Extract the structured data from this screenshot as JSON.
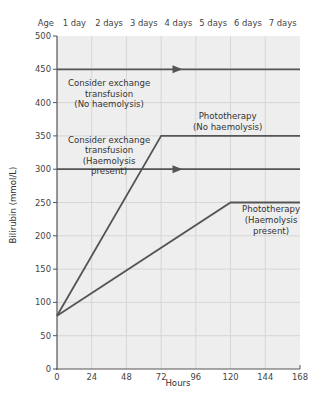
{
  "chart_data": {
    "type": "line",
    "title": "",
    "xlabel": "Hours",
    "ylabel": "Bilirubin (mmol/L)",
    "xlim": [
      0,
      168
    ],
    "ylim": [
      0,
      500
    ],
    "x_ticks": [
      0,
      24,
      48,
      72,
      96,
      120,
      144,
      168
    ],
    "y_ticks": [
      0,
      50,
      100,
      150,
      200,
      250,
      300,
      350,
      400,
      450,
      500
    ],
    "top_axis": {
      "label": "Age",
      "ticks": [
        "1 day",
        "2 days",
        "3 days",
        "4 days",
        "5 days",
        "6 days",
        "7 days"
      ]
    },
    "grid": true,
    "legend": null,
    "series": [
      {
        "name": "Consider exchange transfusion (No haemolysis)",
        "x": [
          0,
          168
        ],
        "y": [
          450,
          450
        ],
        "arrow_at_x": 84
      },
      {
        "name": "Consider exchange transfusion (Haemolysis present)",
        "x": [
          0,
          168
        ],
        "y": [
          300,
          300
        ],
        "arrow_at_x": 84
      },
      {
        "name": "Phototherapy (No haemolysis)",
        "x": [
          0,
          72,
          168
        ],
        "y": [
          80,
          350,
          350
        ]
      },
      {
        "name": "Phototherapy (Haemolysis present)",
        "x": [
          0,
          120,
          168
        ],
        "y": [
          80,
          250,
          250
        ]
      }
    ],
    "annotations": [
      {
        "lines": [
          "Consider exchange",
          "transfusion",
          "(No haemolysis)"
        ],
        "x": 36,
        "y": 425
      },
      {
        "lines": [
          "Consider exchange",
          "transfusion",
          "(Haemolysis",
          "present)"
        ],
        "x": 36,
        "y": 340
      },
      {
        "lines": [
          "Phototherapy",
          "(No haemolysis)"
        ],
        "x": 118,
        "y": 375
      },
      {
        "lines": [
          "Phototherapy",
          "(Haemolysis",
          "present)"
        ],
        "x": 148,
        "y": 235
      }
    ],
    "colors": {
      "line": "#555555",
      "background": "#eeeeee",
      "grid": "#d6d6d6"
    }
  }
}
